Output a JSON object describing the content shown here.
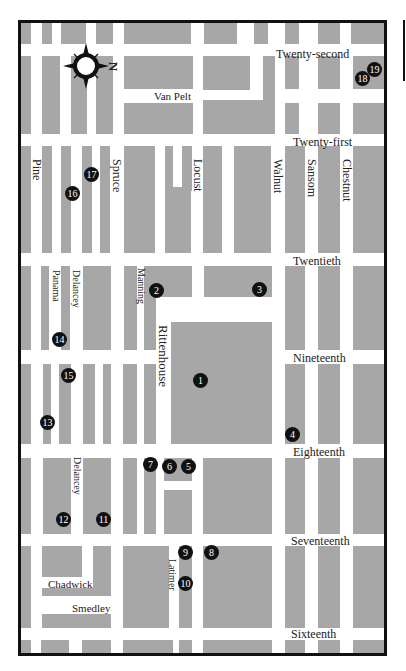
{
  "map": {
    "title": "Rittenhouse Square area street map",
    "colors": {
      "block": "#a7a7a7",
      "street": "#ffffff",
      "frame": "#111111",
      "pin": "#111111",
      "pin_text": "#ffffff"
    },
    "compass": {
      "label": "N"
    },
    "streets_horizontal": [
      {
        "name": "Twenty-second",
        "x": 255,
        "y": 25
      },
      {
        "name": "Van Pelt",
        "x": 136,
        "y": 71
      },
      {
        "name": "Twenty-first",
        "x": 272,
        "y": 115
      },
      {
        "name": "Twentieth",
        "x": 272,
        "y": 234
      },
      {
        "name": "Nineteenth",
        "x": 272,
        "y": 333
      },
      {
        "name": "Eighteenth",
        "x": 272,
        "y": 426
      },
      {
        "name": "Seventeenth",
        "x": 270,
        "y": 515
      },
      {
        "name": "Sixteenth",
        "x": 272,
        "y": 609
      },
      {
        "name": "Chadwick",
        "x": 30,
        "y": 560
      },
      {
        "name": "Smedley",
        "x": 54,
        "y": 585
      }
    ],
    "streets_vertical": [
      {
        "name": "Pine",
        "x": 14,
        "y": 140
      },
      {
        "name": "Spruce",
        "x": 93,
        "y": 140
      },
      {
        "name": "Locust",
        "x": 174,
        "y": 140
      },
      {
        "name": "Walnut",
        "x": 254,
        "y": 140
      },
      {
        "name": "Sansom",
        "x": 289,
        "y": 140
      },
      {
        "name": "Chestnut",
        "x": 323,
        "y": 140
      },
      {
        "name": "Panama",
        "x": 34,
        "y": 250
      },
      {
        "name": "Delancey",
        "x": 55,
        "y": 250
      },
      {
        "name": "Manning",
        "x": 118,
        "y": 248
      },
      {
        "name": "Rittenhouse",
        "x": 139,
        "y": 305
      },
      {
        "name": "Delancey",
        "x": 55,
        "y": 437
      },
      {
        "name": "Latimer",
        "x": 150,
        "y": 540
      }
    ],
    "markers": [
      {
        "n": "1",
        "x": 179,
        "y": 357
      },
      {
        "n": "2",
        "x": 130,
        "y": 262
      },
      {
        "n": "3",
        "x": 233,
        "y": 262
      },
      {
        "n": "4",
        "x": 266,
        "y": 409
      },
      {
        "n": "5",
        "x": 161,
        "y": 440
      },
      {
        "n": "6",
        "x": 143,
        "y": 440
      },
      {
        "n": "7",
        "x": 124,
        "y": 438
      },
      {
        "n": "8",
        "x": 186,
        "y": 530
      },
      {
        "n": "9",
        "x": 159,
        "y": 530
      },
      {
        "n": "10",
        "x": 159,
        "y": 561
      },
      {
        "n": "11",
        "x": 76,
        "y": 492
      },
      {
        "n": "12",
        "x": 37,
        "y": 492
      },
      {
        "n": "13",
        "x": 20,
        "y": 399
      },
      {
        "n": "14",
        "x": 32,
        "y": 314
      },
      {
        "n": "15",
        "x": 40,
        "y": 350
      },
      {
        "n": "16",
        "x": 45,
        "y": 166
      },
      {
        "n": "17",
        "x": 64,
        "y": 147
      },
      {
        "n": "18",
        "x": 337,
        "y": 50
      },
      {
        "n": "19",
        "x": 349,
        "y": 39
      }
    ]
  }
}
